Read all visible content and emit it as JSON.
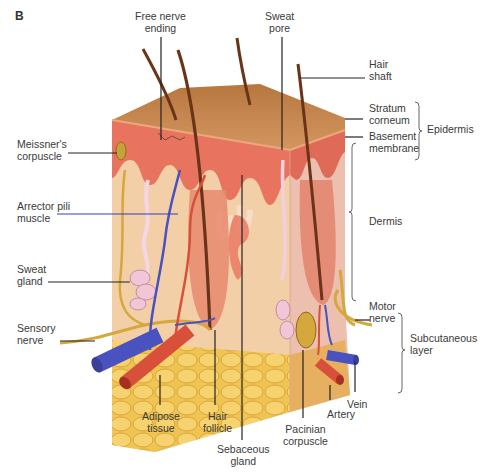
{
  "figure": {
    "panel_letter": "B",
    "colors": {
      "surface": "#c98a52",
      "epidermis": "#e8745f",
      "dermis": "#f2c9a3",
      "dermis_right_face": "#ecbcaa",
      "adipose": "#f0c453",
      "artery": "#d9503a",
      "vein": "#5a5fbf",
      "nerve": "#d4a83c",
      "hair": "#6a3418",
      "sweat_gland": "#f1c6d6",
      "label_text": "#3a3a3a",
      "leader_line": "#222222",
      "blue_leader": "#3040c0"
    },
    "labels": {
      "free_nerve_ending": "Free nerve\nending",
      "sweat_pore": "Sweat\npore",
      "hair_shaft": "Hair\nshaft",
      "stratum_corneum": "Stratum\ncorneum",
      "basement_membrane": "Basement\nmembrane",
      "epidermis": "Epidermis",
      "meissners_corpuscle": "Meissner's\ncorpuscle",
      "arrector_pili_muscle": "Arrector pili\nmuscle",
      "dermis": "Dermis",
      "sweat_gland": "Sweat\ngland",
      "sensory_nerve": "Sensory\nnerve",
      "motor_nerve": "Motor\nnerve",
      "subcutaneous_layer": "Subcutaneous\nlayer",
      "adipose_tissue": "Adipose\ntissue",
      "hair_follicle": "Hair\nfollicle",
      "sebaceous_gland": "Sebaceous\ngland",
      "pacinian_corpuscle": "Pacinian\ncorpuscle",
      "artery": "Artery",
      "vein": "Vein"
    }
  }
}
